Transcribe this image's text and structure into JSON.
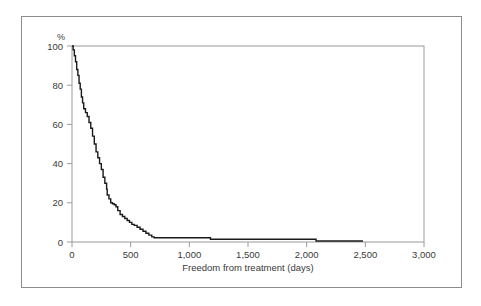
{
  "figure": {
    "border_color": "#8d8d8d",
    "background": "#ffffff"
  },
  "chart_data": {
    "type": "line",
    "subtype": "kaplan-meier-survival-curve",
    "title": "",
    "subtitle": "",
    "xlabel": "Freedom from treatment (days)",
    "ylabel": "",
    "yunit": "%",
    "xlim": [
      0,
      3000
    ],
    "ylim": [
      0,
      100
    ],
    "grid": false,
    "legend": "none",
    "line_color": "#1a1a1a",
    "axis_color": "#9a9a9a",
    "xticks": [
      0,
      500,
      1000,
      1500,
      2000,
      2500,
      3000
    ],
    "xtick_labels": [
      "0",
      "500",
      "1,000",
      "1,500",
      "2,000",
      "2,500",
      "3,000"
    ],
    "yticks": [
      0,
      20,
      40,
      60,
      80,
      100
    ],
    "ytick_labels": [
      "0",
      "20",
      "40",
      "60",
      "80",
      "100"
    ],
    "series": [
      {
        "name": "Freedom from treatment",
        "x": [
          0,
          10,
          20,
          30,
          40,
          50,
          60,
          70,
          80,
          90,
          100,
          115,
          130,
          145,
          160,
          175,
          190,
          205,
          220,
          235,
          250,
          265,
          280,
          295,
          300,
          315,
          330,
          345,
          360,
          375,
          390,
          410,
          430,
          450,
          470,
          490,
          510,
          530,
          555,
          580,
          605,
          630,
          655,
          680,
          700,
          760,
          830,
          900,
          1000,
          1100,
          1170,
          1180,
          1300,
          1450,
          1600,
          1750,
          1900,
          2020,
          2080,
          2100,
          2200,
          2350,
          2480
        ],
        "y": [
          100,
          98,
          95,
          92,
          88,
          85,
          81,
          78,
          74,
          71,
          68,
          66,
          64,
          61,
          58,
          54,
          50,
          46,
          43,
          40,
          37,
          33,
          30,
          27,
          24,
          22,
          20,
          19.5,
          19,
          18,
          16,
          14,
          13,
          12,
          11,
          10,
          9,
          8.5,
          7.5,
          6.5,
          5.5,
          4.5,
          3.5,
          2.6,
          2.2,
          2.2,
          2.2,
          2.2,
          2.2,
          2.2,
          2.2,
          1.4,
          1.4,
          1.4,
          1.4,
          1.4,
          1.4,
          1.4,
          0.5,
          0.5,
          0.5,
          0.5,
          0.5
        ]
      }
    ],
    "annotations": []
  }
}
